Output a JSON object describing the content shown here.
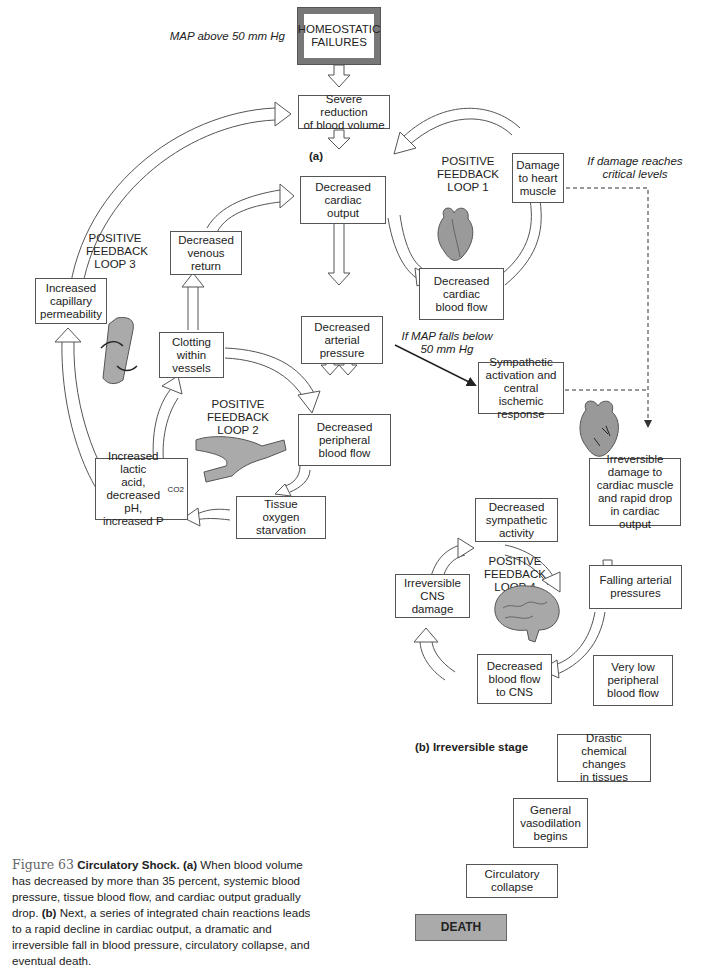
{
  "diagram": {
    "title_box": "HOMEOSTATIC\nFAILURES",
    "map_above": "MAP above 50 mm Hg",
    "stage_a_label": "(a)",
    "stage_b_label": "(b) Irreversible stage",
    "nodes": {
      "severe_reduction": "Severe reduction\nof blood volume",
      "decreased_cardiac_output": "Decreased\ncardiac\noutput",
      "damage_heart_muscle": "Damage\nto heart\nmuscle",
      "decreased_cardiac_blood_flow": "Decreased\ncardiac\nblood flow",
      "decreased_venous_return": "Decreased\nvenous\nreturn",
      "increased_capillary_permeability": "Increased\ncapillary\npermeability",
      "clotting_within_vessels": "Clotting\nwithin\nvessels",
      "decreased_arterial_pressure": "Decreased\narterial\npressure",
      "decreased_peripheral_blood_flow": "Decreased\nperipheral\nblood flow",
      "increased_lactic_acid": "Increased lactic\nacid,\ndecreased pH,\nincreased P",
      "increased_lactic_acid_sub": "CO2",
      "tissue_oxygen_starvation": "Tissue\noxygen\nstarvation",
      "sympathetic_activation": "Sympathetic\nactivation and\ncentral ischemic\nresponse",
      "irreversible_damage_cardiac": "Irreversible\ndamage to\ncardiac muscle\nand rapid drop\nin cardiac output",
      "decreased_sympathetic_activity": "Decreased\nsympathetic\nactivity",
      "irreversible_cns_damage": "Irreversible\nCNS damage",
      "falling_arterial_pressures": "Falling arterial\npressures",
      "decreased_blood_flow_cns": "Decreased\nblood flow\nto CNS",
      "very_low_peripheral_blood_flow": "Very low\nperipheral\nblood flow",
      "drastic_chemical_changes": "Drastic\nchemical changes\nin tissues",
      "general_vasodilation": "General\nvasodilation\nbegins",
      "circulatory_collapse": "Circulatory\ncollapse",
      "death": "DEATH"
    },
    "loops": {
      "loop1": "POSITIVE\nFEEDBACK\nLOOP 1",
      "loop2": "POSITIVE FEEDBACK\nLOOP 2",
      "loop3": "POSITIVE\nFEEDBACK\nLOOP 3",
      "loop4": "POSITIVE FEEDBACK\nLOOP 4"
    },
    "annotations": {
      "damage_critical": "If damage reaches\ncritical levels",
      "map_falls": "If MAP falls below\n50 mm Hg"
    },
    "illustrations": [
      "heart-icon",
      "vessel-icon",
      "branching-vessels-icon",
      "heart-damaged-icon",
      "brain-icon"
    ],
    "colors": {
      "box_border": "#555555",
      "homeostatic_border": "#777777",
      "death_fill": "#aaaaaa",
      "arrow_stroke": "#555555"
    }
  },
  "caption": {
    "figure_label": "Figure 63",
    "title": "Circulatory Shock.",
    "part_a": "(a)",
    "text_a": " When blood volume has decreased by more than 35 percent, systemic blood pressure, tissue blood flow, and cardiac output gradually drop. ",
    "part_b": "(b)",
    "text_b": " Next, a series of integrated chain reactions leads to a rapid decline in cardiac output, a dramatic and irreversible fall in blood pressure, circulatory collapse, and eventual death."
  }
}
